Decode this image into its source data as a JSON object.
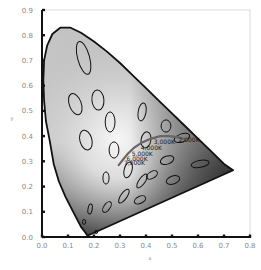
{
  "chart_data": {
    "type": "scatter",
    "title": "",
    "subtitle": "CIE 1931 chromaticity diagram with MacAdam ellipses and Planckian locus",
    "xlabel": "x",
    "ylabel": "y",
    "xlim": [
      0.0,
      0.8
    ],
    "ylim": [
      0.0,
      0.9
    ],
    "grid": false,
    "legend": null,
    "x_ticks": [
      "0.0",
      "0.1",
      "0.2",
      "0.3",
      "0.4",
      "0.5",
      "0.6",
      "0.7",
      "0.8"
    ],
    "y_ticks": [
      "0.0",
      "0.1",
      "0.2",
      "0.3",
      "0.4",
      "0.5",
      "0.6",
      "0.7",
      "0.8",
      "0.9"
    ],
    "spectral_locus": [
      [
        0.175,
        0.005
      ],
      [
        0.165,
        0.02
      ],
      [
        0.15,
        0.04
      ],
      [
        0.135,
        0.07
      ],
      [
        0.115,
        0.11
      ],
      [
        0.09,
        0.16
      ],
      [
        0.065,
        0.22
      ],
      [
        0.045,
        0.29
      ],
      [
        0.03,
        0.38
      ],
      [
        0.015,
        0.46
      ],
      [
        0.008,
        0.54
      ],
      [
        0.005,
        0.62
      ],
      [
        0.008,
        0.7
      ],
      [
        0.02,
        0.76
      ],
      [
        0.04,
        0.805
      ],
      [
        0.07,
        0.83
      ],
      [
        0.11,
        0.83
      ],
      [
        0.15,
        0.81
      ],
      [
        0.2,
        0.775
      ],
      [
        0.25,
        0.735
      ],
      [
        0.3,
        0.69
      ],
      [
        0.35,
        0.64
      ],
      [
        0.4,
        0.59
      ],
      [
        0.45,
        0.54
      ],
      [
        0.5,
        0.49
      ],
      [
        0.55,
        0.44
      ],
      [
        0.6,
        0.39
      ],
      [
        0.65,
        0.34
      ],
      [
        0.7,
        0.29
      ],
      [
        0.735,
        0.265
      ]
    ],
    "purple_line": [
      [
        0.735,
        0.265
      ],
      [
        0.175,
        0.005
      ]
    ],
    "planckian_locus": [
      [
        0.295,
        0.285
      ],
      [
        0.31,
        0.305
      ],
      [
        0.33,
        0.33
      ],
      [
        0.355,
        0.355
      ],
      [
        0.385,
        0.375
      ],
      [
        0.42,
        0.39
      ],
      [
        0.455,
        0.4
      ],
      [
        0.49,
        0.4
      ],
      [
        0.525,
        0.395
      ],
      [
        0.56,
        0.385
      ]
    ],
    "cct_labels": [
      {
        "label": "2,000K",
        "x": 0.525,
        "y": 0.375
      },
      {
        "label": "3,000K",
        "x": 0.43,
        "y": 0.37
      },
      {
        "label": "4,000K",
        "x": 0.38,
        "y": 0.345
      },
      {
        "label": "5,000K",
        "x": 0.345,
        "y": 0.322
      },
      {
        "label": "6,000K",
        "x": 0.325,
        "y": 0.302
      },
      {
        "label": "7,000K",
        "x": 0.315,
        "y": 0.284
      }
    ],
    "macadam_ellipses": [
      {
        "cx": 0.16,
        "cy": 0.71,
        "rx": 0.023,
        "ry": 0.067,
        "angle": -15
      },
      {
        "cx": 0.128,
        "cy": 0.527,
        "rx": 0.023,
        "ry": 0.044,
        "angle": -20
      },
      {
        "cx": 0.215,
        "cy": 0.543,
        "rx": 0.023,
        "ry": 0.04,
        "angle": -5
      },
      {
        "cx": 0.262,
        "cy": 0.456,
        "rx": 0.019,
        "ry": 0.04,
        "angle": 0
      },
      {
        "cx": 0.169,
        "cy": 0.384,
        "rx": 0.023,
        "ry": 0.04,
        "angle": -15
      },
      {
        "cx": 0.277,
        "cy": 0.345,
        "rx": 0.019,
        "ry": 0.032,
        "angle": 0
      },
      {
        "cx": 0.385,
        "cy": 0.496,
        "rx": 0.015,
        "ry": 0.036,
        "angle": 10
      },
      {
        "cx": 0.4,
        "cy": 0.385,
        "rx": 0.019,
        "ry": 0.032,
        "angle": 10
      },
      {
        "cx": 0.477,
        "cy": 0.44,
        "rx": 0.019,
        "ry": 0.024,
        "angle": 0
      },
      {
        "cx": 0.538,
        "cy": 0.393,
        "rx": 0.031,
        "ry": 0.016,
        "angle": -20
      },
      {
        "cx": 0.481,
        "cy": 0.305,
        "rx": 0.027,
        "ry": 0.016,
        "angle": -20
      },
      {
        "cx": 0.608,
        "cy": 0.29,
        "rx": 0.035,
        "ry": 0.014,
        "angle": -10
      },
      {
        "cx": 0.331,
        "cy": 0.266,
        "rx": 0.015,
        "ry": 0.032,
        "angle": 15
      },
      {
        "cx": 0.246,
        "cy": 0.234,
        "rx": 0.012,
        "ry": 0.024,
        "angle": 0
      },
      {
        "cx": 0.385,
        "cy": 0.222,
        "rx": 0.012,
        "ry": 0.032,
        "angle": 35
      },
      {
        "cx": 0.504,
        "cy": 0.226,
        "rx": 0.027,
        "ry": 0.016,
        "angle": -20
      },
      {
        "cx": 0.423,
        "cy": 0.246,
        "rx": 0.023,
        "ry": 0.013,
        "angle": -30
      },
      {
        "cx": 0.315,
        "cy": 0.162,
        "rx": 0.012,
        "ry": 0.032,
        "angle": 35
      },
      {
        "cx": 0.377,
        "cy": 0.147,
        "rx": 0.023,
        "ry": 0.014,
        "angle": -25
      },
      {
        "cx": 0.25,
        "cy": 0.119,
        "rx": 0.012,
        "ry": 0.024,
        "angle": 35
      },
      {
        "cx": 0.185,
        "cy": 0.111,
        "rx": 0.008,
        "ry": 0.02,
        "angle": 10
      },
      {
        "cx": 0.162,
        "cy": 0.06,
        "rx": 0.006,
        "ry": 0.01,
        "angle": 0
      },
      {
        "cx": 0.208,
        "cy": 0.02,
        "rx": 0.006,
        "ry": 0.006,
        "angle": 0
      }
    ],
    "fill_gradient": {
      "top": "#c4c4c4",
      "center": "#f4f4f4",
      "bottom": "#3a3a3a",
      "right": "#2e2e2e"
    }
  },
  "axes": {
    "x_label": "x",
    "y_label": "y"
  }
}
